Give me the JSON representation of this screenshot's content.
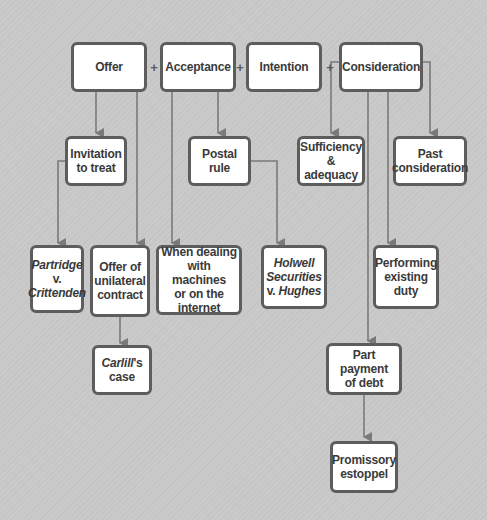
{
  "diagram": {
    "title": "",
    "plus_sign": "+",
    "top_row": [
      {
        "id": "offer",
        "label": "Offer"
      },
      {
        "id": "acceptance",
        "label": "Acceptance"
      },
      {
        "id": "intention",
        "label": "Intention"
      },
      {
        "id": "consideration",
        "label": "Consideration"
      }
    ],
    "nodes": {
      "invitation_to_treat": {
        "line1": "Invitation",
        "line2": "to treat"
      },
      "postal_rule": {
        "line1": "Postal rule"
      },
      "sufficiency": {
        "line1": "Sufficiency",
        "line2": "& adequacy"
      },
      "past_consideration": {
        "line1": "Past",
        "line2": "consideration"
      },
      "partridge": {
        "line1": "Partridge",
        "line2": "v.",
        "line3": "Crittenden"
      },
      "unilateral": {
        "line1": "Offer of",
        "line2": "unilateral",
        "line3": "contract"
      },
      "machines": {
        "line1": "When dealing",
        "line2": "with machines",
        "line3": "or on the",
        "line4": "internet"
      },
      "holwell": {
        "line1": "Holwell",
        "line2": "Securities",
        "line3_prefix": "v. ",
        "line3_italic": "Hughes"
      },
      "performing_duty": {
        "line1": "Performing",
        "line2": "existing",
        "line3": "duty"
      },
      "carlill": {
        "italic": "Carlill",
        "suffix": "'s",
        "line2": "case"
      },
      "part_payment": {
        "line1": "Part payment",
        "line2": "of debt"
      },
      "promissory": {
        "line1": "Promissory",
        "line2": "estoppel"
      }
    },
    "edges": [
      [
        "Offer",
        "Invitation to treat"
      ],
      [
        "Offer",
        "Offer of unilateral contract"
      ],
      [
        "Invitation to treat",
        "Partridge v. Crittenden"
      ],
      [
        "Offer of unilateral contract",
        "Carlill's case"
      ],
      [
        "Acceptance",
        "Postal rule"
      ],
      [
        "Acceptance",
        "When dealing with machines or on the internet"
      ],
      [
        "Postal rule",
        "Holwell Securities v. Hughes"
      ],
      [
        "Consideration",
        "Sufficiency & adequacy"
      ],
      [
        "Consideration",
        "Past consideration"
      ],
      [
        "Consideration",
        "Performing existing duty"
      ],
      [
        "Consideration",
        "Part payment of debt"
      ],
      [
        "Part payment of debt",
        "Promissory estoppel"
      ]
    ],
    "colors": {
      "background": "#c9c9c9",
      "box_fill": "#ffffff",
      "box_border": "#5d5d5d",
      "text": "#3a3a3a",
      "connector": "#7a7a7a"
    }
  }
}
